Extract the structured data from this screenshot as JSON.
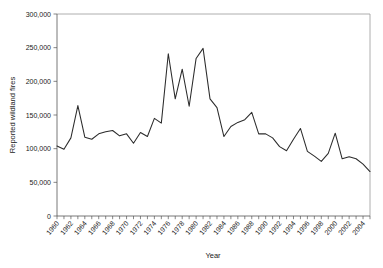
{
  "chart_data": {
    "type": "line",
    "title": "",
    "subtitle": "",
    "xlabel": "Year",
    "ylabel": "Reported wildland fires",
    "xlim": [
      1960,
      2005
    ],
    "ylim": [
      0,
      300000
    ],
    "grid": false,
    "legend": null,
    "y_ticks": [
      0,
      50000,
      100000,
      150000,
      200000,
      250000,
      300000
    ],
    "y_tick_labels": [
      "0",
      "50,000",
      "100,000",
      "150,000",
      "200,000",
      "250,000",
      "300,000"
    ],
    "x_ticks": [
      1960,
      1961,
      1962,
      1963,
      1964,
      1965,
      1966,
      1967,
      1968,
      1969,
      1970,
      1971,
      1972,
      1973,
      1974,
      1975,
      1976,
      1977,
      1978,
      1979,
      1980,
      1981,
      1982,
      1983,
      1984,
      1985,
      1986,
      1987,
      1988,
      1989,
      1990,
      1991,
      1992,
      1993,
      1994,
      1995,
      1996,
      1997,
      1998,
      1999,
      2000,
      2001,
      2002,
      2003,
      2004,
      2005
    ],
    "x_tick_labels": [
      "1960",
      "1962",
      "1964",
      "1966",
      "1968",
      "1970",
      "1972",
      "1974",
      "1976",
      "1978",
      "1980",
      "1982",
      "1984",
      "1986",
      "1988",
      "1990",
      "1992",
      "1994",
      "1996",
      "1998",
      "2000",
      "2002",
      "2004"
    ],
    "x_tick_label_values": [
      1960,
      1962,
      1964,
      1966,
      1968,
      1970,
      1972,
      1974,
      1976,
      1978,
      1980,
      1982,
      1984,
      1986,
      1988,
      1990,
      1992,
      1994,
      1996,
      1998,
      2000,
      2002,
      2004
    ],
    "line_color": "#2b2b2b",
    "x": [
      1960,
      1961,
      1962,
      1963,
      1964,
      1965,
      1966,
      1967,
      1968,
      1969,
      1970,
      1971,
      1972,
      1973,
      1974,
      1975,
      1976,
      1977,
      1978,
      1979,
      1980,
      1981,
      1982,
      1983,
      1984,
      1985,
      1986,
      1987,
      1988,
      1989,
      1990,
      1991,
      1992,
      1993,
      1994,
      1995,
      1996,
      1997,
      1998,
      1999,
      2000,
      2001,
      2002,
      2003,
      2004,
      2005
    ],
    "values": [
      104000,
      99000,
      116000,
      164000,
      117000,
      114000,
      122000,
      125000,
      127000,
      119000,
      122000,
      108000,
      124000,
      118000,
      145000,
      138000,
      241000,
      174000,
      218000,
      163000,
      234000,
      249000,
      174000,
      161000,
      118000,
      133000,
      139000,
      143000,
      154000,
      122000,
      122000,
      116000,
      103000,
      97000,
      114000,
      130000,
      96000,
      89000,
      81000,
      93000,
      123000,
      85000,
      88000,
      85000,
      77000,
      66000
    ],
    "series": [
      {
        "name": "Reported wildland fires",
        "values": [
          104000,
          99000,
          116000,
          164000,
          117000,
          114000,
          122000,
          125000,
          127000,
          119000,
          122000,
          108000,
          124000,
          118000,
          145000,
          138000,
          241000,
          174000,
          218000,
          163000,
          234000,
          249000,
          174000,
          161000,
          118000,
          133000,
          139000,
          143000,
          154000,
          122000,
          122000,
          116000,
          103000,
          97000,
          114000,
          130000,
          96000,
          89000,
          81000,
          93000,
          123000,
          85000,
          88000,
          85000,
          77000,
          66000
        ]
      }
    ]
  }
}
